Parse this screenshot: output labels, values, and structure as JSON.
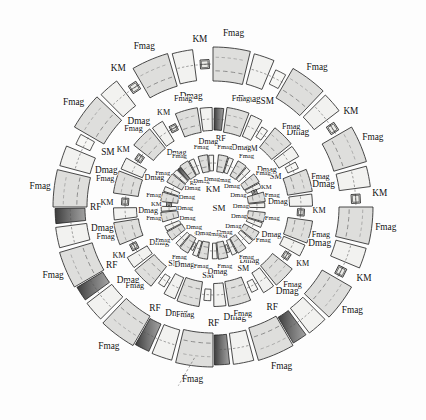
{
  "figure": {
    "background_color": "#fdfdfd",
    "center": {
      "x": 213,
      "y": 207
    },
    "center_labels": [
      {
        "text": "KM",
        "x": 213,
        "y": 190
      },
      {
        "text": "SM",
        "x": 219,
        "y": 209
      }
    ]
  },
  "legend_terms": {
    "fmag": "Fmag",
    "dmag": "Dmag",
    "sm": "SM",
    "km": "KM",
    "rf": "RF"
  },
  "colors": {
    "fmag_fill": "#dededc",
    "dmag_fill": "#f2f2f0",
    "sm_fill": "#f7f7f5",
    "km_fill": "#ebebe8",
    "rf_fill_dark": "#4a4a4a",
    "rf_fill_light": "#9a9a9a",
    "outline": "#2b2b2b",
    "beam_line": "#6b6b6b",
    "label_text": "#111111"
  },
  "rings": [
    {
      "name": "outer-ring",
      "radius": 143,
      "cell_count": 12,
      "start_angle": -90,
      "label_radius": 176,
      "element_labels": [
        "Fmag",
        "Dmag",
        "SM",
        "KM",
        "RF"
      ],
      "cells": [
        {
          "index": 0,
          "angle": -90,
          "fmag": "Fmag",
          "dmag": "Dmag",
          "small": "SM",
          "rf": null
        },
        {
          "index": 1,
          "angle": -60,
          "fmag": "Fmag",
          "dmag": "Dmag",
          "small": "KM",
          "rf": null
        },
        {
          "index": 2,
          "angle": -30,
          "fmag": "Fmag",
          "dmag": "Dmag",
          "small": "KM",
          "rf": null
        },
        {
          "index": 3,
          "angle": 0,
          "fmag": "Fmag",
          "dmag": "Dmag",
          "small": "KM",
          "rf": null
        },
        {
          "index": 4,
          "angle": 30,
          "fmag": "Fmag",
          "dmag": "Dmag",
          "small": null,
          "rf": "RF"
        },
        {
          "index": 5,
          "angle": 60,
          "fmag": "Fmag",
          "dmag": "Dmag",
          "small": null,
          "rf": "RF"
        },
        {
          "index": 6,
          "angle": 90,
          "fmag": "Fmag",
          "dmag": "Dmag",
          "small": "SM",
          "rf": "RF"
        },
        {
          "index": 7,
          "angle": 120,
          "fmag": "Fmag",
          "dmag": "Dmag",
          "small": "SM",
          "rf": "RF"
        },
        {
          "index": 8,
          "angle": 150,
          "fmag": "Fmag",
          "dmag": "Dmag",
          "small": null,
          "rf": "RF"
        },
        {
          "index": 9,
          "angle": 180,
          "fmag": "Fmag",
          "dmag": "Dmag",
          "small": "SM",
          "rf": null
        },
        {
          "index": 10,
          "angle": 210,
          "fmag": "Fmag",
          "dmag": "Dmag",
          "small": "KM",
          "rf": null
        },
        {
          "index": 11,
          "angle": 240,
          "fmag": "Fmag",
          "dmag": "Dmag",
          "small": "KM",
          "rf": null
        }
      ]
    },
    {
      "name": "middle-ring",
      "radius": 88,
      "cell_count": 12,
      "start_angle": -82,
      "label_radius": 112,
      "element_labels": [
        "Fmag",
        "Dmag",
        "SM",
        "KM",
        "RF"
      ],
      "cells": [
        {
          "index": 0,
          "angle": -82,
          "fmag": "Fmag",
          "dmag": "Dmag",
          "small": "SM",
          "rf": null
        },
        {
          "index": 1,
          "angle": -52,
          "fmag": "Fmag",
          "dmag": "Dmag",
          "small": "SM",
          "rf": null
        },
        {
          "index": 2,
          "angle": -22,
          "fmag": "Fmag",
          "dmag": "Dmag",
          "small": "KM",
          "rf": null
        },
        {
          "index": 3,
          "angle": 8,
          "fmag": "Fmag",
          "dmag": "Dmag",
          "small": "KM",
          "rf": null
        },
        {
          "index": 4,
          "angle": 38,
          "fmag": "Fmag",
          "dmag": "Dmag",
          "small": "SM",
          "rf": null
        },
        {
          "index": 5,
          "angle": 68,
          "fmag": "Fmag",
          "dmag": "Dmag",
          "small": "SM",
          "rf": null
        },
        {
          "index": 6,
          "angle": 98,
          "fmag": "Fmag",
          "dmag": "Dmag",
          "small": "SM",
          "rf": null
        },
        {
          "index": 7,
          "angle": 128,
          "fmag": "Fmag",
          "dmag": "Dmag",
          "small": "KM",
          "rf": null
        },
        {
          "index": 8,
          "angle": 158,
          "fmag": "Fmag",
          "dmag": "Dmag",
          "small": "KM",
          "rf": null
        },
        {
          "index": 9,
          "angle": 188,
          "fmag": "Fmag",
          "dmag": "Dmag",
          "small": "KM",
          "rf": null
        },
        {
          "index": 10,
          "angle": 218,
          "fmag": "Fmag",
          "dmag": "Dmag",
          "small": "KM",
          "rf": null
        },
        {
          "index": 11,
          "angle": 248,
          "fmag": "Fmag",
          "dmag": "Dmag",
          "small": "RF",
          "rf": "RF"
        }
      ]
    },
    {
      "name": "inner-ring",
      "radius": 44,
      "cell_count": 16,
      "start_angle": -84,
      "label_radius": 60,
      "element_labels": [
        "Fmag",
        "Dmag",
        "SM",
        "KM",
        "RF"
      ],
      "cells": [
        {
          "index": 0,
          "angle": -84,
          "fmag": "Fmag",
          "dmag": "Dmag",
          "small": null,
          "rf": null
        },
        {
          "index": 1,
          "angle": -61,
          "fmag": "Fmag",
          "dmag": "Dmag",
          "small": null,
          "rf": null
        },
        {
          "index": 2,
          "angle": -39,
          "fmag": "Fmag",
          "dmag": "Dmag",
          "small": "KM",
          "rf": null
        },
        {
          "index": 3,
          "angle": -16,
          "fmag": "Fmag",
          "dmag": "Dmag",
          "small": null,
          "rf": null
        },
        {
          "index": 4,
          "angle": 6,
          "fmag": "Fmag",
          "dmag": "Dmag",
          "small": null,
          "rf": null
        },
        {
          "index": 5,
          "angle": 29,
          "fmag": "Fmag",
          "dmag": "Dmag",
          "small": null,
          "rf": null
        },
        {
          "index": 6,
          "angle": 51,
          "fmag": "Fmag",
          "dmag": "Dmag",
          "small": "SM",
          "rf": null
        },
        {
          "index": 7,
          "angle": 74,
          "fmag": "Fmag",
          "dmag": "Dmag",
          "small": null,
          "rf": null
        },
        {
          "index": 8,
          "angle": 96,
          "fmag": "Fmag",
          "dmag": "Dmag",
          "small": "SM",
          "rf": null
        },
        {
          "index": 9,
          "angle": 119,
          "fmag": "Fmag",
          "dmag": "Dmag",
          "small": null,
          "rf": null
        },
        {
          "index": 10,
          "angle": 141,
          "fmag": "Fmag",
          "dmag": "Dmag",
          "small": null,
          "rf": null
        },
        {
          "index": 11,
          "angle": 164,
          "fmag": "Fmag",
          "dmag": "Dmag",
          "small": "KM",
          "rf": null
        },
        {
          "index": 12,
          "angle": 186,
          "fmag": "Fmag",
          "dmag": "Dmag",
          "small": null,
          "rf": null
        },
        {
          "index": 13,
          "angle": 209,
          "fmag": "Fmag",
          "dmag": "Dmag",
          "small": null,
          "rf": "RF"
        },
        {
          "index": 14,
          "angle": 231,
          "fmag": "Fmag",
          "dmag": "Dmag",
          "small": null,
          "rf": null
        },
        {
          "index": 15,
          "angle": 254,
          "fmag": "Fmag",
          "dmag": "Dmag",
          "small": null,
          "rf": null
        }
      ]
    }
  ]
}
